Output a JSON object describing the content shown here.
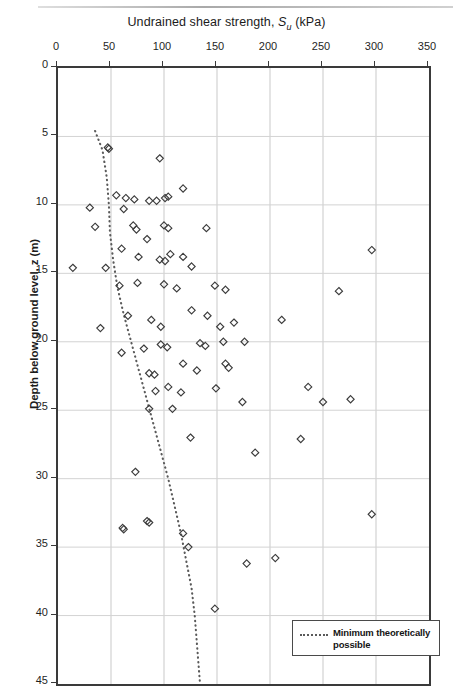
{
  "figure": {
    "title_prefix": "Undrained shear strength, ",
    "title_symbol": "S",
    "title_symbol_sub": "u",
    "title_suffix": " (kPa)",
    "ylabel": "Depth below ground level, z (m)"
  },
  "legend": {
    "position": "bottom-right",
    "entries": [
      {
        "label": "Minimum theoretically possible",
        "style": "dotted",
        "color": "#5a5a5a"
      }
    ]
  },
  "chart_data": {
    "type": "scatter",
    "title": "Undrained shear strength, Su (kPa)",
    "xlabel": "Undrained shear strength, Su (kPa)",
    "ylabel": "Depth below ground level, z (m)",
    "xlim": [
      0,
      350
    ],
    "ylim": [
      0,
      45
    ],
    "y_inverted": true,
    "x_ticks": [
      0,
      50,
      100,
      150,
      200,
      250,
      300,
      350
    ],
    "y_ticks": [
      0,
      5,
      10,
      15,
      20,
      25,
      30,
      35,
      40,
      45
    ],
    "grid": true,
    "marker": "open-diamond",
    "marker_color": "#3c3c3c",
    "series": [
      {
        "name": "Undrained shear strength measurements",
        "points": [
          [
            47,
            5.8
          ],
          [
            48,
            5.9
          ],
          [
            96,
            6.6
          ],
          [
            55,
            9.3
          ],
          [
            64,
            9.5
          ],
          [
            72,
            9.6
          ],
          [
            86,
            9.7
          ],
          [
            93,
            9.7
          ],
          [
            101,
            9.5
          ],
          [
            104,
            9.4
          ],
          [
            118,
            8.8
          ],
          [
            30,
            10.2
          ],
          [
            62,
            10.3
          ],
          [
            35,
            11.6
          ],
          [
            71,
            11.5
          ],
          [
            74,
            11.8
          ],
          [
            100,
            11.5
          ],
          [
            104,
            11.7
          ],
          [
            84,
            12.5
          ],
          [
            140,
            11.7
          ],
          [
            14,
            14.6
          ],
          [
            45,
            14.6
          ],
          [
            60,
            13.2
          ],
          [
            76,
            13.8
          ],
          [
            96,
            14.0
          ],
          [
            101,
            14.1
          ],
          [
            106,
            13.6
          ],
          [
            118,
            13.8
          ],
          [
            126,
            14.5
          ],
          [
            296,
            13.3
          ],
          [
            58,
            15.9
          ],
          [
            75,
            15.7
          ],
          [
            100,
            15.8
          ],
          [
            112,
            16.1
          ],
          [
            148,
            15.9
          ],
          [
            158,
            16.2
          ],
          [
            265,
            16.3
          ],
          [
            40,
            19.0
          ],
          [
            66,
            18.1
          ],
          [
            88,
            18.4
          ],
          [
            97,
            18.9
          ],
          [
            126,
            17.7
          ],
          [
            141,
            18.1
          ],
          [
            153,
            18.9
          ],
          [
            166,
            18.6
          ],
          [
            60,
            20.8
          ],
          [
            81,
            20.5
          ],
          [
            97,
            20.2
          ],
          [
            103,
            20.4
          ],
          [
            134,
            20.1
          ],
          [
            139,
            20.3
          ],
          [
            156,
            20.0
          ],
          [
            211,
            18.4
          ],
          [
            86,
            22.3
          ],
          [
            91,
            22.4
          ],
          [
            118,
            21.6
          ],
          [
            131,
            22.1
          ],
          [
            158,
            21.6
          ],
          [
            161,
            21.9
          ],
          [
            176,
            20.0
          ],
          [
            92,
            23.6
          ],
          [
            104,
            23.3
          ],
          [
            116,
            23.7
          ],
          [
            149,
            23.4
          ],
          [
            86,
            24.9
          ],
          [
            108,
            24.9
          ],
          [
            174,
            24.4
          ],
          [
            236,
            23.3
          ],
          [
            250,
            24.4
          ],
          [
            125,
            27.0
          ],
          [
            186,
            28.1
          ],
          [
            73,
            29.5
          ],
          [
            84,
            33.1
          ],
          [
            86,
            33.2
          ],
          [
            61,
            33.6
          ],
          [
            62,
            33.7
          ],
          [
            118,
            34.0
          ],
          [
            123,
            35.0
          ],
          [
            178,
            36.2
          ],
          [
            205,
            35.8
          ],
          [
            148,
            39.5
          ],
          [
            296,
            32.6
          ],
          [
            276,
            24.2
          ],
          [
            229,
            27.1
          ]
        ]
      }
    ],
    "trend_line": {
      "name": "Minimum theoretically possible",
      "style": "dotted",
      "color": "#5a5a5a",
      "points": [
        [
          35,
          4.6
        ],
        [
          42,
          6.0
        ],
        [
          46,
          8.0
        ],
        [
          48,
          10.0
        ],
        [
          49,
          12.0
        ],
        [
          52,
          14.0
        ],
        [
          56,
          16.0
        ],
        [
          62,
          18.0
        ],
        [
          69,
          20.0
        ],
        [
          76,
          22.0
        ],
        [
          83,
          24.0
        ],
        [
          90,
          26.0
        ],
        [
          97,
          28.0
        ],
        [
          104,
          30.0
        ],
        [
          110,
          32.0
        ],
        [
          116,
          34.0
        ],
        [
          121,
          36.0
        ],
        [
          126,
          38.0
        ],
        [
          129,
          40.0
        ],
        [
          131,
          42.0
        ],
        [
          133,
          44.0
        ],
        [
          134,
          45.0
        ]
      ]
    }
  }
}
